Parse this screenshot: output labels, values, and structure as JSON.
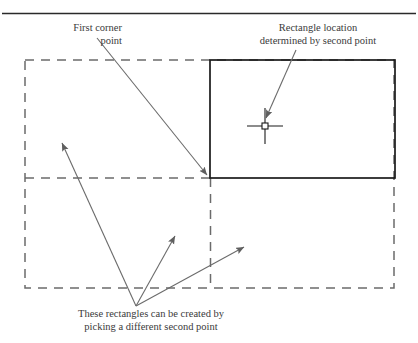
{
  "figure": {
    "title_rule": "horizontal-rule",
    "annotations": {
      "first_corner": {
        "line1": "First corner",
        "line2": "point"
      },
      "rectangle_location": {
        "line1": "Rectangle location",
        "line2": "determined by second point"
      },
      "caption": {
        "line1": "These rectangles can be created by",
        "line2": "picking a different second point"
      }
    },
    "colors": {
      "line": "#1a1a1a",
      "dashed": "#6b6b6b",
      "arrow": "#6b6b6b",
      "text": "#3a3a3a",
      "rule": "#2a2a2a",
      "background": "#ffffff"
    },
    "shapes": {
      "solid_rectangle": {
        "x": 210,
        "y": 60,
        "width": 185,
        "height": 118,
        "style": "solid",
        "description": "active rectangle preview"
      },
      "dashed_outer_rectangle": {
        "x": 25,
        "y": 60,
        "width": 369,
        "height": 228,
        "style": "dashed",
        "description": "alternate rectangle candidates"
      },
      "dashed_divider_horizontal": {
        "x1": 25,
        "y1": 178,
        "x2": 210,
        "y2": 178
      },
      "dashed_divider_vertical": {
        "x1": 210,
        "y1": 178,
        "x2": 210,
        "y2": 288
      },
      "crosshair_cursor": {
        "cx": 265,
        "cy": 126,
        "arm": 18,
        "box": 5
      },
      "first_corner_point": {
        "x": 210,
        "y": 178
      }
    },
    "arrows": [
      {
        "name": "first-corner-arrow",
        "x1": 97,
        "y1": 38,
        "x2": 208,
        "y2": 176
      },
      {
        "name": "rectangle-location-arrow",
        "x1": 296,
        "y1": 50,
        "x2": 266,
        "y2": 119
      },
      {
        "name": "caption-arrow-left",
        "x1": 136,
        "y1": 306,
        "x2": 61,
        "y2": 142
      },
      {
        "name": "caption-arrow-middle",
        "x1": 136,
        "y1": 306,
        "x2": 175,
        "y2": 235
      },
      {
        "name": "caption-arrow-right",
        "x1": 136,
        "y1": 306,
        "x2": 245,
        "y2": 246
      }
    ]
  }
}
